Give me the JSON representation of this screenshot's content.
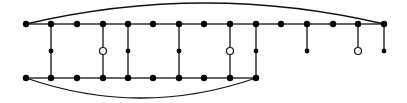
{
  "diagram": {
    "type": "graph",
    "colors": {
      "line": "#111111",
      "node": "#000000",
      "background": "#ffffff"
    },
    "rows": {
      "top_y": 24,
      "middle_y": 51,
      "bottom_y": 78
    },
    "top_row_x": [
      26,
      51,
      77,
      103,
      128,
      153,
      179,
      204,
      230,
      256,
      281,
      307,
      333,
      358,
      384
    ],
    "bottom_row_x": [
      26,
      51,
      77,
      103,
      128,
      153,
      179,
      204,
      230,
      256
    ],
    "rungs": [
      {
        "x": 51,
        "mid": "filled"
      },
      {
        "x": 103,
        "mid": "hollow"
      },
      {
        "x": 128,
        "mid": "filled"
      },
      {
        "x": 179,
        "mid": "filled"
      },
      {
        "x": 230,
        "mid": "hollow"
      },
      {
        "x": 256,
        "mid": "filled"
      }
    ],
    "pendants": [
      {
        "x": 307,
        "end": "filled"
      },
      {
        "x": 358,
        "end": "hollow"
      },
      {
        "x": 384,
        "end": "filled"
      }
    ],
    "arcs": [
      {
        "name": "top-arc",
        "from_x": 26,
        "to_x": 384,
        "y": 24,
        "peak_y": 3
      },
      {
        "name": "bottom-arc",
        "from_x": 26,
        "to_x": 256,
        "y": 78,
        "peak_y": 98
      }
    ]
  }
}
